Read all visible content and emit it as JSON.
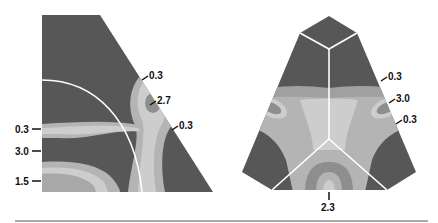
{
  "colors": {
    "dark": "#575757",
    "mid": "#8e8e8e",
    "light": "#b4b4b4",
    "lighter": "#cdcdcd",
    "boundary": "#ffffff",
    "label": "#111111",
    "rule": "#555555"
  },
  "left_panel": {
    "labels": [
      {
        "text": "0.3",
        "side": "left"
      },
      {
        "text": "3.0",
        "side": "left"
      },
      {
        "text": "1.5",
        "side": "left"
      },
      {
        "text": "0.3",
        "side": "right"
      },
      {
        "text": "2.7",
        "side": "right"
      },
      {
        "text": "0.3",
        "side": "right"
      }
    ]
  },
  "right_panel": {
    "labels": [
      {
        "text": "0.3",
        "side": "right"
      },
      {
        "text": "3.0",
        "side": "right"
      },
      {
        "text": "0.3",
        "side": "right"
      },
      {
        "text": "2.3",
        "side": "bottom"
      }
    ]
  }
}
